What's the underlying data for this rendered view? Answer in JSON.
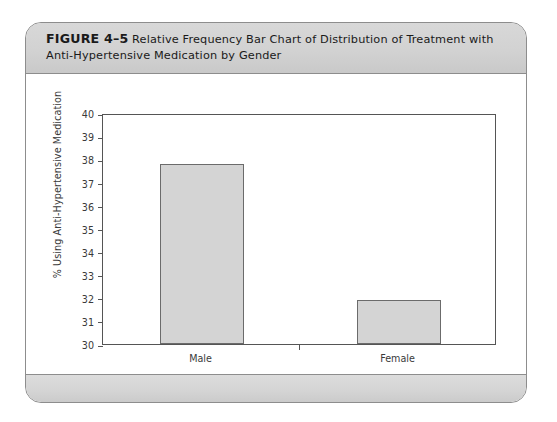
{
  "figure": {
    "number": "FIGURE 4–5",
    "caption": "Relative Frequency Bar Chart of Distribution of Treatment with Anti-Hypertensive Medication by Gender"
  },
  "chart_data": {
    "type": "bar",
    "title": "Relative Frequency Bar Chart of Distribution of Treatment with Anti-Hypertensive Medication by Gender",
    "categories": [
      "Male",
      "Female"
    ],
    "values": [
      37.8,
      31.9
    ],
    "xlabel": "Gender",
    "ylabel": "% Using Anti-Hypertensive Medication",
    "ylim": [
      30,
      40
    ],
    "ytick_step": 1,
    "yticks": [
      40,
      39,
      38,
      37,
      36,
      35,
      34,
      33,
      32,
      31,
      30
    ],
    "ytick_labels": [
      "40",
      "39",
      "38",
      "37",
      "36",
      "35",
      "34",
      "33",
      "32",
      "31",
      "30"
    ],
    "grid": false,
    "legend": false,
    "bar_fill": "#d4d4d4",
    "bar_edge": "#6b6b6b"
  }
}
